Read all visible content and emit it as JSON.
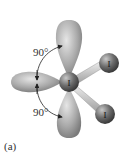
{
  "figure": {
    "panel_label": "(a)",
    "angle_labels": [
      "90°",
      "90°"
    ],
    "central_atom": "I",
    "bonded_atoms": [
      "I",
      "I"
    ],
    "lone_pair_lobes": 3,
    "colors": {
      "lobe": "#a8a8a8",
      "atom": "#6a6a6a",
      "bond": "#cfcfcf",
      "arrow": "#222222"
    }
  }
}
